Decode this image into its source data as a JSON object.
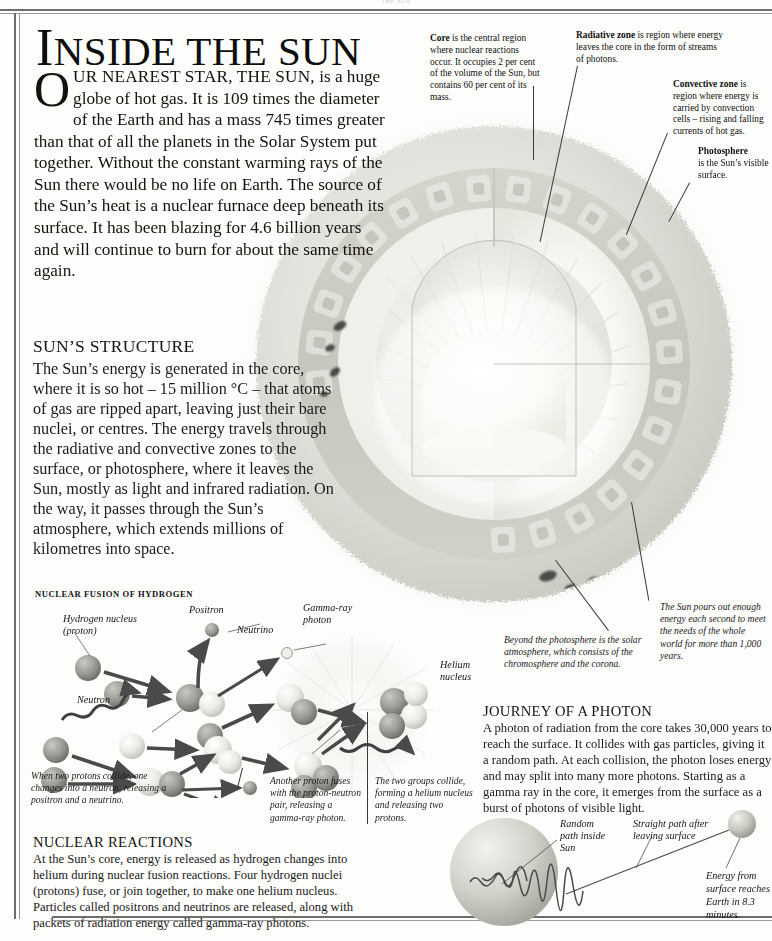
{
  "page": {
    "running_head": "THE SUN"
  },
  "title": {
    "first_letter": "I",
    "rest": "NSIDE THE SUN",
    "full": "INSIDE THE SUN"
  },
  "intro": {
    "dropcap": "O",
    "smallcaps_lead": "UR NEAREST STAR, THE SUN,",
    "body": " is a huge globe of hot gas. It is 109 times the diameter of the Earth and has a mass 745 times greater than that of all the planets in the Solar System put together. Without the constant warming rays of the Sun there would be no life on Earth. The source of the Sun’s heat is a nuclear furnace deep beneath its surface. It has been blazing for 4.6 billion years and will continue to burn for about the same time again."
  },
  "structure": {
    "heading": "SUN’S STRUCTURE",
    "body": "The Sun’s energy is generated in the core, where it is so hot – 15 million °C – that atoms of gas are ripped apart, leaving just their bare nuclei, or centres. The energy travels through the radiative and convective zones to the surface, or photosphere, where it leaves the Sun, mostly as light and infrared radiation. On the way, it passes through the Sun’s atmosphere, which extends millions of kilometres into space."
  },
  "callouts": {
    "core": {
      "term": "Core",
      "text": " is the central region where nuclear reactions occur. It occupies 2 per cent of the volume of the Sun, but contains 60 per cent of its mass."
    },
    "radiative": {
      "term": "Radiative zone",
      "text": " is region where energy leaves the core in the form of streams of photons."
    },
    "convective": {
      "term": "Convective zone",
      "text": " is region where energy is carried by convection cells – rising and falling currents of hot gas."
    },
    "photosphere": {
      "term": "Photosphere",
      "text": " is the Sun’s visible surface."
    }
  },
  "captions": {
    "atmosphere": "Beyond the photosphere is the solar atmosphere, which consists of the chromosphere and the corona.",
    "energy_output": "The Sun pours out enough energy each second to meet the needs of the whole world for more than 1,000 years."
  },
  "fusion": {
    "heading": "NUCLEAR FUSION OF HYDROGEN",
    "labels": {
      "hydrogen_nucleus": "Hydrogen nucleus\n(proton)",
      "hydrogen_nucleus_l1": "Hydrogen nucleus",
      "hydrogen_nucleus_l2": "(proton)",
      "positron": "Positron",
      "neutrino": "Neutrino",
      "neutron": "Neutron",
      "gamma_ray_photon_l1": "Gamma-ray",
      "gamma_ray_photon_l2": "photon",
      "helium_nucleus_l1": "Helium",
      "helium_nucleus_l2": "nucleus"
    },
    "captions": {
      "step1": "When two protons collide, one changes into a neutron, releasing a positron and a neutrino.",
      "step2": "Another proton fuses with the proton-neutron pair, releasing a gamma-ray photon.",
      "step3": "The two groups collide, forming a helium nucleus and releasing two protons."
    }
  },
  "nuclear_reactions": {
    "heading": "NUCLEAR REACTIONS",
    "body": "At the Sun’s core, energy is released as hydrogen changes into helium during nuclear fusion reactions. Four hydrogen nuclei (protons) fuse, or join together, to make one helium nucleus. Particles called positrons and neutrinos are released, along with packets of radiation energy called gamma-ray photons."
  },
  "journey": {
    "heading": "JOURNEY OF A PHOTON",
    "body": "A photon of radiation from the core takes 30,000 years to reach the surface. It collides with gas particles, giving it a random path. At each collision, the photon loses energy and may split into many more photons. Starting as a gamma ray in the core, it emerges from the surface as a burst of photons of visible light.",
    "labels": {
      "random_path_l1": "Random",
      "random_path_l2": "path inside",
      "random_path_l3": "Sun",
      "straight_path_l1": "Straight path after",
      "straight_path_l2": "leaving surface",
      "earth_energy": "Energy from surface reaches Earth in 8.3 minutes."
    }
  },
  "colors": {
    "ink": "#141414",
    "rule": "#6d6d6d",
    "sun_body": "#dcdcd6",
    "sun_glow": "#f4f4f0",
    "convection_cell": "#b9b9b3",
    "sphere": "#b0b0ac",
    "leader": "#3a3a3a"
  }
}
